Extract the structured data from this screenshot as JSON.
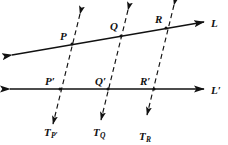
{
  "figure": {
    "type": "geometry-diagram",
    "background_color": "#ffffff",
    "stroke_color": "#111111"
  },
  "lines": [
    {
      "id": "line-L",
      "label": "L",
      "label_x": 211,
      "label_y": 18,
      "x1": 12,
      "y1": 55,
      "x2": 204,
      "y2": 22,
      "style": "solid",
      "arrow_start": true,
      "arrow_end": true
    },
    {
      "id": "line-L-prime",
      "label": "L′",
      "label_x": 211,
      "label_y": 85,
      "x1": 10,
      "y1": 89,
      "x2": 204,
      "y2": 89,
      "style": "solid",
      "arrow_start": true,
      "arrow_end": true
    }
  ],
  "transversals": [
    {
      "id": "transversal-P",
      "label": "T",
      "sublabel": "P′",
      "label_x": 44,
      "label_y": 127,
      "x1": 80,
      "y1": 14,
      "x2": 53,
      "y2": 124,
      "style": "dashed",
      "arrow_start": true,
      "arrow_end": true
    },
    {
      "id": "transversal-Q",
      "label": "T",
      "sublabel": "Q",
      "label_x": 93,
      "label_y": 127,
      "x1": 128,
      "y1": 10,
      "x2": 101,
      "y2": 120,
      "style": "dashed",
      "arrow_start": true,
      "arrow_end": true
    },
    {
      "id": "transversal-R",
      "label": "T",
      "sublabel": "R",
      "label_x": 139,
      "label_y": 132,
      "x1": 174,
      "y1": 5,
      "x2": 147,
      "y2": 115,
      "style": "dashed",
      "arrow_start": true,
      "arrow_end": true
    }
  ],
  "points": [
    {
      "id": "point-P",
      "label": "P",
      "x": 72,
      "y": 44,
      "label_x": 60,
      "label_y": 31
    },
    {
      "id": "point-Q",
      "label": "Q",
      "x": 121,
      "y": 36,
      "label_x": 110,
      "label_y": 21
    },
    {
      "id": "point-R",
      "label": "R",
      "x": 166,
      "y": 28,
      "label_x": 155,
      "label_y": 14
    },
    {
      "id": "point-P-prime",
      "label": "P′",
      "x": 60,
      "y": 89,
      "label_x": 45,
      "label_y": 76
    },
    {
      "id": "point-Q-prime",
      "label": "Q′",
      "x": 108,
      "y": 89,
      "label_x": 95,
      "label_y": 76
    },
    {
      "id": "point-R-prime",
      "label": "R′",
      "x": 154,
      "y": 89,
      "label_x": 140,
      "label_y": 76
    }
  ]
}
